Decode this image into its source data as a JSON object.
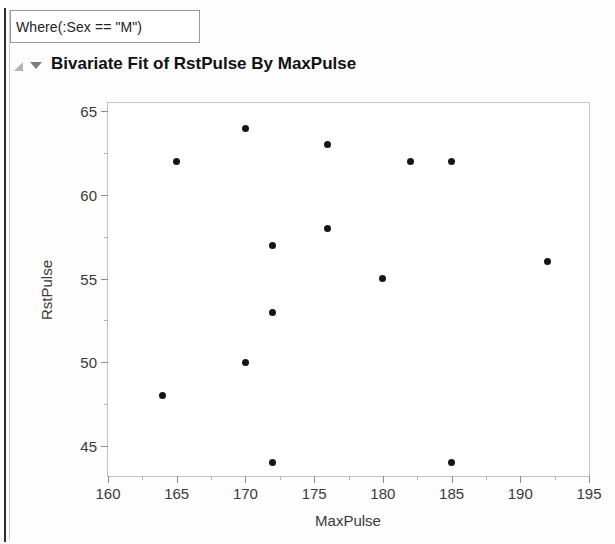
{
  "window": {
    "filter_expression": "Where(:Sex == \"M\")",
    "report_title": "Bivariate Fit of RstPulse By MaxPulse",
    "disclosure_open_icon": "triangle-open-icon",
    "disclosure_down_icon": "triangle-down-icon"
  },
  "chart_data": {
    "type": "scatter",
    "title": "Bivariate Fit of RstPulse By MaxPulse",
    "xlabel": "MaxPulse",
    "ylabel": "RstPulse",
    "xlim": [
      160,
      195
    ],
    "ylim": [
      43.2,
      65.5
    ],
    "xticks": [
      160,
      165,
      170,
      175,
      180,
      185,
      190,
      195
    ],
    "yticks": [
      45,
      50,
      55,
      60,
      65
    ],
    "xtick_labels": [
      "160",
      "165",
      "170",
      "175",
      "180",
      "185",
      "190",
      "195"
    ],
    "ytick_labels": [
      "45",
      "50",
      "55",
      "60",
      "65"
    ],
    "x_minor_step": 2.5,
    "y_minor_step": 2.5,
    "grid": false,
    "legend": null,
    "marker_color": "#151515",
    "frame_color": "#c4c4c4",
    "series": [
      {
        "name": "RstPulse vs MaxPulse",
        "x": [
          164,
          165,
          170,
          170,
          172,
          172,
          172,
          176,
          176,
          180,
          182,
          185,
          185,
          192
        ],
        "y": [
          48,
          62,
          50,
          64,
          44,
          53,
          57,
          58,
          63,
          55,
          62,
          44,
          62,
          56
        ]
      }
    ]
  }
}
